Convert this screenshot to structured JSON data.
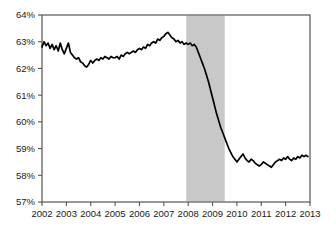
{
  "chart_data": {
    "type": "line",
    "title": "",
    "subtitle": "",
    "xlabel": "",
    "ylabel": "",
    "xlim": [
      2002.0,
      2013.0
    ],
    "ylim": [
      57,
      64
    ],
    "grid": false,
    "legend": null,
    "y_tick_labels": [
      "64%",
      "63%",
      "62%",
      "61%",
      "60%",
      "59%",
      "58%",
      "57%"
    ],
    "y_tick_values": [
      64,
      63,
      62,
      61,
      60,
      59,
      58,
      57
    ],
    "x_tick_labels": [
      "2002",
      "2003",
      "2004",
      "2005",
      "2006",
      "2007",
      "2008",
      "2009",
      "2010",
      "2011",
      "2012",
      "2013"
    ],
    "x_tick_values": [
      2002,
      2003,
      2004,
      2005,
      2006,
      2007,
      2008,
      2009,
      2010,
      2011,
      2012,
      2013
    ],
    "line_color": "#000000",
    "line_width": 1.7,
    "frame_color": "#555555",
    "shaded_regions": [
      {
        "name": "recession-band",
        "x_start": 2007.92,
        "x_end": 2009.5,
        "color": "#c8c8c8"
      }
    ],
    "series": [
      {
        "name": "employment-population-ratio",
        "x": [
          2002.0,
          2002.083,
          2002.167,
          2002.25,
          2002.333,
          2002.417,
          2002.5,
          2002.583,
          2002.667,
          2002.75,
          2002.833,
          2002.917,
          2003.0,
          2003.083,
          2003.167,
          2003.25,
          2003.333,
          2003.417,
          2003.5,
          2003.583,
          2003.667,
          2003.75,
          2003.833,
          2003.917,
          2004.0,
          2004.083,
          2004.167,
          2004.25,
          2004.333,
          2004.417,
          2004.5,
          2004.583,
          2004.667,
          2004.75,
          2004.833,
          2004.917,
          2005.0,
          2005.083,
          2005.167,
          2005.25,
          2005.333,
          2005.417,
          2005.5,
          2005.583,
          2005.667,
          2005.75,
          2005.833,
          2005.917,
          2006.0,
          2006.083,
          2006.167,
          2006.25,
          2006.333,
          2006.417,
          2006.5,
          2006.583,
          2006.667,
          2006.75,
          2006.833,
          2006.917,
          2007.0,
          2007.083,
          2007.167,
          2007.25,
          2007.333,
          2007.417,
          2007.5,
          2007.583,
          2007.667,
          2007.75,
          2007.833,
          2007.917,
          2008.0,
          2008.083,
          2008.167,
          2008.25,
          2008.333,
          2008.417,
          2008.5,
          2008.583,
          2008.667,
          2008.75,
          2008.833,
          2008.917,
          2009.0,
          2009.083,
          2009.167,
          2009.25,
          2009.333,
          2009.417,
          2009.5,
          2009.583,
          2009.667,
          2009.75,
          2009.833,
          2009.917,
          2010.0,
          2010.083,
          2010.167,
          2010.25,
          2010.333,
          2010.417,
          2010.5,
          2010.583,
          2010.667,
          2010.75,
          2010.833,
          2010.917,
          2011.0,
          2011.083,
          2011.167,
          2011.25,
          2011.333,
          2011.417,
          2011.5,
          2011.583,
          2011.667,
          2011.75,
          2011.833,
          2011.917,
          2012.0,
          2012.083,
          2012.167,
          2012.25,
          2012.333,
          2012.417,
          2012.5,
          2012.583,
          2012.667,
          2012.75,
          2012.833,
          2012.917
        ],
        "values": [
          62.8,
          63.0,
          62.85,
          62.95,
          62.75,
          62.9,
          62.7,
          62.85,
          62.65,
          62.95,
          62.7,
          62.55,
          62.75,
          62.95,
          62.6,
          62.5,
          62.4,
          62.35,
          62.4,
          62.25,
          62.2,
          62.1,
          62.05,
          62.15,
          62.3,
          62.2,
          62.3,
          62.35,
          62.3,
          62.4,
          62.35,
          62.45,
          62.4,
          62.35,
          62.45,
          62.4,
          62.4,
          62.45,
          62.35,
          62.5,
          62.45,
          62.55,
          62.6,
          62.55,
          62.6,
          62.65,
          62.6,
          62.7,
          62.75,
          62.7,
          62.8,
          62.75,
          62.9,
          62.85,
          62.95,
          63.0,
          62.95,
          63.1,
          63.05,
          63.15,
          63.2,
          63.3,
          63.35,
          63.25,
          63.15,
          63.1,
          63.0,
          63.05,
          62.95,
          63.0,
          62.9,
          62.95,
          62.9,
          62.95,
          62.85,
          62.9,
          62.8,
          62.6,
          62.4,
          62.2,
          62.0,
          61.75,
          61.5,
          61.2,
          60.9,
          60.6,
          60.3,
          60.05,
          59.8,
          59.6,
          59.4,
          59.2,
          59.0,
          58.85,
          58.7,
          58.6,
          58.5,
          58.6,
          58.7,
          58.8,
          58.65,
          58.55,
          58.5,
          58.6,
          58.55,
          58.45,
          58.4,
          58.35,
          58.4,
          58.5,
          58.45,
          58.4,
          58.35,
          58.3,
          58.4,
          58.5,
          58.55,
          58.6,
          58.55,
          58.65,
          58.6,
          58.7,
          58.6,
          58.55,
          58.65,
          58.6,
          58.7,
          58.65,
          58.75,
          58.7,
          58.75,
          58.7
        ]
      }
    ]
  }
}
